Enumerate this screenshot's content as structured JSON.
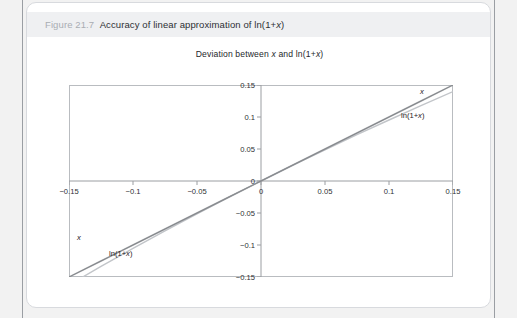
{
  "caption": {
    "number": "Figure 21.7",
    "title": "Accuracy of linear approximation of ln(1+x)"
  },
  "chart_data": {
    "type": "line",
    "title": "Deviation between x and ln(1+x)",
    "xlabel": "",
    "ylabel": "",
    "xlim": [
      -0.15,
      0.15
    ],
    "ylim": [
      -0.15,
      0.15
    ],
    "grid": false,
    "legend_position": "inline-endpoints",
    "xticks": [
      "-0.15",
      "-0.1",
      "-0.05",
      "0",
      "0.05",
      "0.1",
      "0.15"
    ],
    "xtick_values": [
      -0.15,
      -0.1,
      -0.05,
      0,
      0.05,
      0.1,
      0.15
    ],
    "yticks": [
      "0.15",
      "0.1",
      "0.05",
      "0",
      "-0.05",
      "-0.1",
      "-0.15"
    ],
    "ytick_values": [
      0.15,
      0.1,
      0.05,
      0,
      -0.05,
      -0.1,
      -0.15
    ],
    "x": [
      -0.15,
      -0.125,
      -0.1,
      -0.075,
      -0.05,
      -0.025,
      0,
      0.025,
      0.05,
      0.075,
      0.1,
      0.125,
      0.15
    ],
    "series": [
      {
        "name": "x",
        "color": "#8a8d91",
        "values": [
          -0.15,
          -0.125,
          -0.1,
          -0.075,
          -0.05,
          -0.025,
          0,
          0.025,
          0.05,
          0.075,
          0.1,
          0.125,
          0.15
        ]
      },
      {
        "name": "ln(1+x)",
        "color": "#c2c5c9",
        "values": [
          -0.1625,
          -0.1335,
          -0.1054,
          -0.078,
          -0.0513,
          -0.0253,
          0,
          0.0247,
          0.0488,
          0.0723,
          0.0953,
          0.1178,
          0.1398
        ]
      }
    ],
    "annotations": [
      {
        "text": "x",
        "italic": true,
        "corner": "top-right"
      },
      {
        "text": "ln(1+x)",
        "italic": false,
        "corner": "right"
      },
      {
        "text": "x",
        "italic": true,
        "corner": "bottom-left"
      },
      {
        "text": "ln(1+x)",
        "italic": false,
        "corner": "left"
      }
    ]
  }
}
